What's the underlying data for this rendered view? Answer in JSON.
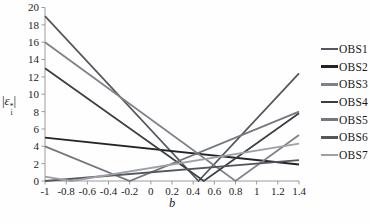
{
  "chart_data": {
    "type": "line",
    "title": "",
    "xlabel": "b",
    "ylabel": "|ε_i^*|",
    "xlim": [
      -1,
      1.4
    ],
    "ylim": [
      0,
      20
    ],
    "x_ticks": [
      "-1",
      "-0.8",
      "-0.6",
      "-0.4",
      "-0.2",
      "0",
      "0.2",
      "0.4",
      "0.6",
      "0.8",
      "1",
      "1.2",
      "1.4"
    ],
    "y_ticks": [
      "0",
      "2",
      "4",
      "6",
      "8",
      "10",
      "12",
      "14",
      "16",
      "18",
      "20"
    ],
    "grid": false,
    "legend_position": "right",
    "axis_color": "#9c9c9c",
    "series": [
      {
        "name": "OBS1",
        "color": "#54585e",
        "points": [
          [
            -1,
            19
          ],
          [
            0.45,
            0
          ],
          [
            1.4,
            12.4
          ]
        ]
      },
      {
        "name": "OBS2",
        "color": "#222428",
        "points": [
          [
            -1,
            5
          ],
          [
            1.4,
            1.9
          ]
        ]
      },
      {
        "name": "OBS3",
        "color": "#7e8287",
        "points": [
          [
            -1,
            16
          ],
          [
            0.8,
            0
          ],
          [
            1.4,
            5.3
          ]
        ]
      },
      {
        "name": "OBS4",
        "color": "#3b3e43",
        "points": [
          [
            -1,
            13
          ],
          [
            0.5,
            0
          ],
          [
            1.4,
            7.8
          ]
        ]
      },
      {
        "name": "OBS5",
        "color": "#74787d",
        "points": [
          [
            -1,
            4
          ],
          [
            -0.2,
            0
          ],
          [
            1.4,
            8.0
          ]
        ]
      },
      {
        "name": "OBS6",
        "color": "#53575c",
        "points": [
          [
            -1,
            0
          ],
          [
            1.4,
            2.4
          ]
        ]
      },
      {
        "name": "OBS7",
        "color": "#9da1a6",
        "points": [
          [
            -1,
            0.5
          ],
          [
            -0.75,
            0
          ],
          [
            1.4,
            4.3
          ]
        ]
      }
    ]
  },
  "ylabel_parts": {
    "open_bar": "|",
    "symbol": "ε",
    "sup": "*",
    "sub": "i",
    "close_bar": "|"
  }
}
